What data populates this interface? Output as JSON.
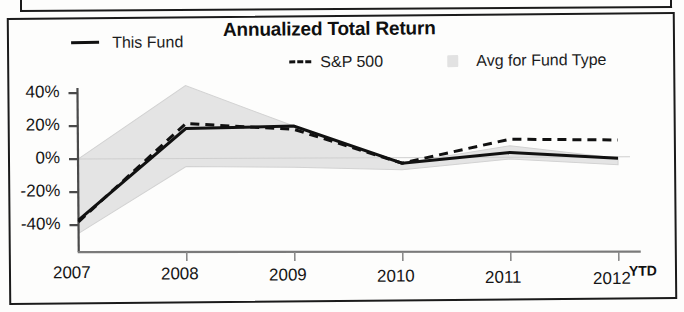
{
  "chart": {
    "title": "Annualized Total Return",
    "legend": [
      {
        "label": "This Fund",
        "marker": "solid-line-swatch"
      },
      {
        "label": "S&P 500",
        "marker": "dashed-line-swatch"
      },
      {
        "label": "Avg for Fund Type",
        "marker": "gray-band-swatch"
      }
    ],
    "ytd_note": "YTD"
  },
  "chart_data": {
    "type": "line",
    "title": "Annualized Total Return",
    "xlabel": "",
    "ylabel": "",
    "categories": [
      "2007",
      "2008",
      "2009",
      "2010",
      "2011",
      "2012"
    ],
    "ytick_labels": [
      "40%",
      "20%",
      "0%",
      "-20%",
      "-40%"
    ],
    "ytick_values": [
      40,
      20,
      0,
      -20,
      -40
    ],
    "ylim": [
      -48,
      48
    ],
    "grid": false,
    "legend_position": "top",
    "series": [
      {
        "name": "This Fund",
        "style": "solid",
        "color": "#111111",
        "values": [
          -37,
          18,
          19,
          -4,
          2,
          -2
        ]
      },
      {
        "name": "S&P 500",
        "style": "dashed",
        "color": "#111111",
        "values": [
          -38,
          21,
          17,
          -4,
          10,
          9
        ]
      },
      {
        "name": "Avg for Fund Type",
        "style": "band",
        "color": "#e3e3e3",
        "upper": [
          0,
          44,
          19,
          -4,
          6,
          -2
        ],
        "lower": [
          -45,
          -5,
          -6,
          -8,
          -2,
          -6
        ]
      }
    ],
    "annotations": [
      {
        "text": "YTD",
        "position": "after-2012-xtick"
      }
    ]
  }
}
